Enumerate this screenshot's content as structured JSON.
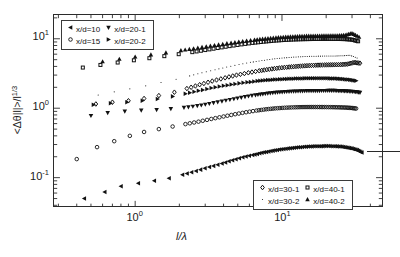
{
  "figure": {
    "background": "#ffffff",
    "axis_color": "#2b2b2b",
    "marker_color": "#111111"
  },
  "axes": {
    "x_title": "l/λ",
    "y_title_main": "<Δθ|l|>/l",
    "y_title_exp": "1/3",
    "x_ticklabels": [
      {
        "base": "10",
        "exp": "0",
        "value": 1
      },
      {
        "base": "10",
        "exp": "1",
        "value": 10
      }
    ],
    "y_ticklabels": [
      {
        "base": "10",
        "exp": "1",
        "value": 10
      },
      {
        "base": "10",
        "exp": "0",
        "value": 1
      },
      {
        "base": "10",
        "exp": "-1",
        "value": 0.1
      }
    ]
  },
  "legend_top": {
    "rows": [
      [
        {
          "label": "x/d=10",
          "marker": "triangle-left"
        },
        {
          "label": "x/d=20-1",
          "marker": "triangle-down"
        }
      ],
      [
        {
          "label": "x/d=15",
          "marker": "circle"
        },
        {
          "label": "x/d=20-2",
          "marker": "triangle-right"
        }
      ]
    ]
  },
  "legend_bottom": {
    "rows": [
      [
        {
          "label": "x/d=30-1",
          "marker": "diamond"
        },
        {
          "label": "x/d=40-1",
          "marker": "square"
        }
      ],
      [
        {
          "label": "x/d=30-2",
          "marker": "dot"
        },
        {
          "label": "x/d=40-2",
          "marker": "triangle-up"
        }
      ]
    ]
  },
  "annotations": {
    "reference_line": {
      "label": "horizontal-reference-line",
      "x_start": 16.0,
      "x_end": 27.0,
      "y": 0.4
    }
  },
  "chart_data": {
    "type": "scatter",
    "title": "",
    "xlabel": "l/λ",
    "ylabel": "<Δθ|l|>/l^(1/3)",
    "xscale": "log",
    "yscale": "log",
    "xlim": [
      0.28,
      48
    ],
    "ylim": [
      0.038,
      22
    ],
    "grid": false,
    "legend_position": "top-left and bottom-right inside axes",
    "series": [
      {
        "name": "x/d=10",
        "marker": "triangle-left",
        "x": [
          0.45,
          0.62,
          0.8,
          1.05,
          1.35,
          1.7,
          2.1,
          2.6,
          3.2,
          3.9,
          4.6,
          5.4,
          6.3,
          7.3,
          8.4,
          9.6,
          11.0,
          12.5,
          14.2,
          16.0,
          18.0,
          20.0,
          22.5,
          25.0,
          27.5,
          30.0,
          32.5,
          35.0
        ],
        "y": [
          0.05,
          0.062,
          0.075,
          0.083,
          0.09,
          0.098,
          0.11,
          0.125,
          0.142,
          0.16,
          0.178,
          0.196,
          0.212,
          0.228,
          0.242,
          0.254,
          0.264,
          0.272,
          0.278,
          0.282,
          0.284,
          0.285,
          0.284,
          0.28,
          0.272,
          0.262,
          0.25,
          0.23
        ]
      },
      {
        "name": "x/d=15",
        "marker": "circle",
        "x": [
          0.4,
          0.55,
          0.72,
          0.92,
          1.15,
          1.45,
          1.8,
          2.2,
          2.7,
          3.3,
          4.0,
          4.8,
          5.7,
          6.7,
          7.8,
          9.0,
          10.4,
          12.0,
          13.7,
          15.5,
          17.5,
          19.5,
          22.0,
          24.5,
          27.0,
          29.5,
          32.0
        ],
        "y": [
          0.185,
          0.275,
          0.335,
          0.4,
          0.455,
          0.5,
          0.545,
          0.59,
          0.64,
          0.7,
          0.76,
          0.82,
          0.875,
          0.925,
          0.965,
          0.995,
          1.015,
          1.03,
          1.038,
          1.04,
          1.04,
          1.038,
          1.035,
          1.03,
          1.022,
          1.01,
          0.99
        ]
      },
      {
        "name": "x/d=20-1",
        "marker": "triangle-down",
        "x": [
          0.5,
          0.65,
          0.85,
          1.1,
          1.4,
          1.75,
          2.15,
          2.65,
          3.2,
          3.9,
          4.7,
          5.6,
          6.6,
          7.7,
          9.0,
          10.4,
          12.0,
          13.8,
          15.8,
          18.0,
          20.5,
          23.0,
          25.5,
          28.0,
          31.0,
          34.0
        ],
        "y": [
          0.78,
          0.86,
          0.9,
          0.93,
          0.95,
          0.98,
          1.02,
          1.08,
          1.16,
          1.26,
          1.36,
          1.46,
          1.55,
          1.62,
          1.68,
          1.72,
          1.75,
          1.77,
          1.78,
          1.785,
          1.79,
          1.79,
          1.78,
          1.76,
          1.73,
          1.68
        ]
      },
      {
        "name": "x/d=20-2",
        "marker": "triangle-right",
        "x": [
          0.52,
          0.68,
          0.88,
          1.12,
          1.42,
          1.8,
          2.2,
          2.7,
          3.3,
          4.0,
          4.8,
          5.8,
          6.8,
          8.0,
          9.3,
          10.8,
          12.4,
          14.2,
          16.2,
          18.5,
          21.0,
          23.5,
          26.0,
          29.0,
          32.0
        ],
        "y": [
          1.12,
          1.18,
          1.22,
          1.28,
          1.36,
          1.48,
          1.62,
          1.78,
          1.95,
          2.1,
          2.24,
          2.36,
          2.46,
          2.54,
          2.6,
          2.64,
          2.67,
          2.69,
          2.7,
          2.7,
          2.69,
          2.67,
          2.63,
          2.57,
          2.48
        ]
      },
      {
        "name": "x/d=30-1",
        "marker": "diamond",
        "x": [
          0.54,
          0.7,
          0.9,
          1.15,
          1.45,
          1.85,
          2.25,
          2.75,
          3.35,
          4.1,
          4.9,
          5.9,
          7.0,
          8.2,
          9.6,
          11.2,
          12.9,
          14.8,
          17.0,
          19.5,
          22.0,
          25.0,
          28.0,
          31.0,
          34.0
        ],
        "y": [
          1.15,
          1.22,
          1.28,
          1.38,
          1.52,
          1.7,
          1.92,
          2.18,
          2.46,
          2.74,
          3.0,
          3.24,
          3.46,
          3.64,
          3.8,
          3.92,
          4.02,
          4.1,
          4.16,
          4.2,
          4.22,
          4.24,
          4.32,
          4.55,
          4.45
        ]
      },
      {
        "name": "x/d=30-2",
        "marker": "dot",
        "x": [
          0.56,
          0.72,
          0.92,
          1.18,
          1.5,
          1.9,
          2.35,
          2.85,
          3.5,
          4.2,
          5.1,
          6.1,
          7.3,
          8.6,
          10.0,
          11.6,
          13.4,
          15.4,
          17.7,
          20.2,
          23.0,
          26.0,
          29.0,
          32.5
        ],
        "y": [
          1.55,
          1.72,
          1.9,
          2.1,
          2.34,
          2.62,
          2.92,
          3.24,
          3.58,
          3.92,
          4.26,
          4.58,
          4.86,
          5.1,
          5.28,
          5.42,
          5.52,
          5.58,
          5.62,
          5.64,
          5.66,
          5.7,
          5.8,
          5.3
        ]
      },
      {
        "name": "x/d=40-1",
        "marker": "square",
        "x": [
          0.44,
          0.58,
          0.76,
          0.98,
          1.25,
          1.58,
          1.98,
          2.45,
          3.0,
          3.65,
          4.4,
          5.3,
          6.3,
          7.5,
          8.8,
          10.3,
          12.0,
          13.9,
          16.0,
          18.4,
          21.0,
          24.0,
          27.0,
          30.0,
          33.0
        ],
        "y": [
          3.85,
          4.2,
          4.55,
          4.9,
          5.25,
          5.62,
          6.0,
          6.42,
          6.88,
          7.36,
          7.84,
          8.3,
          8.72,
          9.08,
          9.38,
          9.6,
          9.76,
          9.86,
          9.92,
          9.95,
          9.96,
          9.94,
          9.88,
          9.72,
          9.2
        ]
      },
      {
        "name": "x/d=40-2",
        "marker": "triangle-up",
        "x": [
          0.6,
          0.78,
          1.0,
          1.28,
          1.62,
          2.05,
          2.5,
          3.05,
          3.7,
          4.5,
          5.4,
          6.5,
          7.7,
          9.1,
          10.6,
          12.3,
          14.2,
          16.3,
          18.7,
          21.3,
          24.0,
          27.0,
          30.0,
          33.5
        ],
        "y": [
          4.7,
          5.1,
          5.5,
          5.9,
          6.32,
          6.78,
          7.24,
          7.72,
          8.22,
          8.72,
          9.2,
          9.66,
          10.05,
          10.38,
          10.64,
          10.82,
          10.95,
          11.02,
          11.06,
          11.08,
          11.1,
          11.3,
          12.0,
          10.6
        ]
      }
    ]
  }
}
